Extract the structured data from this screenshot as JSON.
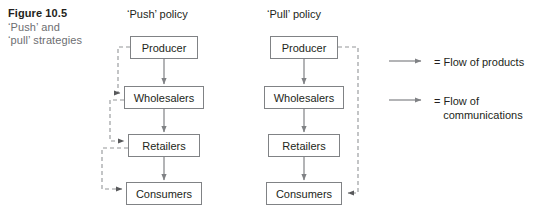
{
  "figure": {
    "caption_title": "Figure 10.5",
    "caption_line1": "‘Push’ and",
    "caption_line2": "‘pull’ strategies"
  },
  "columns": {
    "push": {
      "header": "‘Push’ policy",
      "nodes": [
        {
          "label": "Producer"
        },
        {
          "label": "Wholesalers"
        },
        {
          "label": "Retailers"
        },
        {
          "label": "Consumers"
        }
      ]
    },
    "pull": {
      "header": "‘Pull’ policy",
      "nodes": [
        {
          "label": "Producer"
        },
        {
          "label": "Wholesalers"
        },
        {
          "label": "Retailers"
        },
        {
          "label": "Consumers"
        }
      ]
    }
  },
  "legend": {
    "items": [
      {
        "line_style": "solid",
        "label": "= Flow of products"
      },
      {
        "line_style": "dashed",
        "label": "= Flow of\n   communications"
      }
    ]
  },
  "colors": {
    "box_border": "#808285",
    "solid_arrow": "#808285",
    "dashed_arrow": "#939598",
    "text_dark": "#231f20",
    "text_gray": "#6d6e71",
    "background": "#ffffff"
  }
}
